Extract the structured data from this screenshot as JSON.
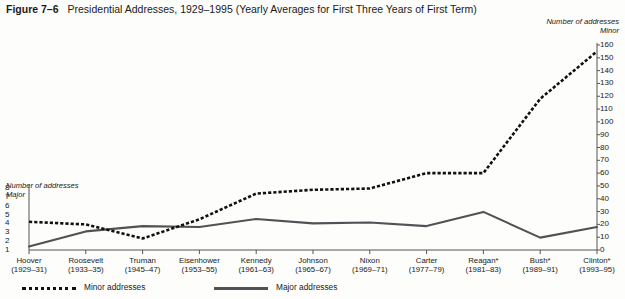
{
  "figure": {
    "label": "Figure 7–6",
    "title": "Presidential Addresses, 1929–1995 (Yearly Averages for First Three Years of First Term)"
  },
  "axes": {
    "right_caption_line1": "Number of addresses",
    "right_caption_line2": "Minor",
    "left_caption_line1": "Number of addresses",
    "left_caption_line2": "Major"
  },
  "legend": {
    "minor_label": "Minor addresses",
    "major_label": "Major addresses"
  },
  "chart_data": {
    "type": "line",
    "title": "Presidential Addresses, 1929–1995 (Yearly Averages for First Three Years of First Term)",
    "xlabel": "",
    "ylabel": "Number of addresses",
    "grid": false,
    "legend_position": "bottom-left",
    "categories": [
      "Hoover",
      "Roosevelt",
      "Truman",
      "Eisenhower",
      "Kennedy",
      "Johnson",
      "Nixon",
      "Carter",
      "Reagan*",
      "Bush*",
      "Clinton*"
    ],
    "category_years": [
      "(1929–31)",
      "(1933–35)",
      "(1945–47)",
      "(1953–55)",
      "(1961–63)",
      "(1965–67)",
      "(1969–71)",
      "(1977–79)",
      "(1981–83)",
      "(1989–91)",
      "(1993–95)"
    ],
    "series": [
      {
        "name": "Minor addresses",
        "axis": "right",
        "ylim": [
          0,
          160
        ],
        "ytick_labels": [
          "160",
          "150",
          "140",
          "130",
          "120",
          "110",
          "100",
          "90",
          "80",
          "70",
          "60",
          "50",
          "40",
          "30",
          "20",
          "10",
          "0"
        ],
        "values": [
          22,
          20,
          9,
          24,
          44,
          47,
          48,
          60,
          60,
          118,
          155
        ],
        "style": "dotted"
      },
      {
        "name": "Major addresses",
        "axis": "left",
        "ylim": [
          1,
          8
        ],
        "ytick_labels": [
          "8",
          "7",
          "6",
          "5",
          "4",
          "3",
          "2",
          "1"
        ],
        "values": [
          1.4,
          3.1,
          3.7,
          3.6,
          4.5,
          4.0,
          4.1,
          3.7,
          5.3,
          2.4,
          3.6
        ],
        "style": "solid"
      }
    ]
  },
  "colors": {
    "minor_line": "#111111",
    "major_line": "#4f5355",
    "axis": "#555555",
    "text": "#1a1a1a"
  }
}
